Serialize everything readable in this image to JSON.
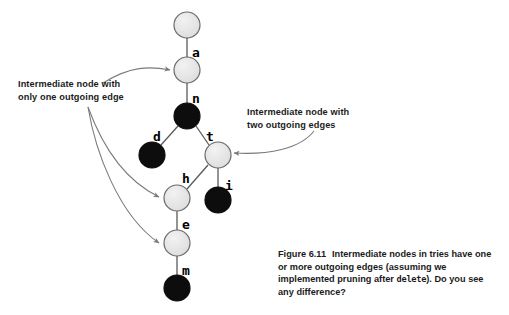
{
  "figure": {
    "nodes": [
      {
        "id": "root",
        "label": "",
        "cx": 187,
        "cy": 25,
        "r": 13,
        "fill": "#e3e3e3",
        "kind": "intermediate"
      },
      {
        "id": "a",
        "label": "",
        "cx": 187,
        "cy": 70,
        "r": 13,
        "fill": "#e3e3e3",
        "kind": "intermediate"
      },
      {
        "id": "n",
        "label": "",
        "cx": 187,
        "cy": 116,
        "r": 13,
        "fill": "#0d0d0d",
        "kind": "terminal"
      },
      {
        "id": "d",
        "label": "",
        "cx": 152,
        "cy": 155,
        "r": 13,
        "fill": "#0d0d0d",
        "kind": "terminal"
      },
      {
        "id": "t",
        "label": "",
        "cx": 218,
        "cy": 155,
        "r": 13,
        "fill": "#e3e3e3",
        "kind": "intermediate"
      },
      {
        "id": "h",
        "label": "",
        "cx": 177,
        "cy": 198,
        "r": 13,
        "fill": "#e3e3e3",
        "kind": "intermediate"
      },
      {
        "id": "i",
        "label": "",
        "cx": 218,
        "cy": 200,
        "r": 13,
        "fill": "#0d0d0d",
        "kind": "terminal"
      },
      {
        "id": "e",
        "label": "",
        "cx": 177,
        "cy": 243,
        "r": 13,
        "fill": "#e3e3e3",
        "kind": "intermediate"
      },
      {
        "id": "m",
        "label": "",
        "cx": 177,
        "cy": 288,
        "r": 13,
        "fill": "#0d0d0d",
        "kind": "terminal"
      }
    ],
    "edges": [
      {
        "from": "root",
        "to": "a",
        "label": "a",
        "label_x": 196,
        "label_y": 52
      },
      {
        "from": "a",
        "to": "n",
        "label": "n",
        "label_x": 196,
        "label_y": 98
      },
      {
        "from": "n",
        "to": "d",
        "label": "d",
        "label_x": 157,
        "label_y": 136
      },
      {
        "from": "n",
        "to": "t",
        "label": "t",
        "label_x": 209,
        "label_y": 136
      },
      {
        "from": "t",
        "to": "h",
        "label": "h",
        "label_x": 186,
        "label_y": 178
      },
      {
        "from": "t",
        "to": "i",
        "label": "i",
        "label_x": 228,
        "label_y": 186
      },
      {
        "from": "h",
        "to": "e",
        "label": "e",
        "label_x": 186,
        "label_y": 224
      },
      {
        "from": "e",
        "to": "m",
        "label": "m",
        "label_x": 186,
        "label_y": 270
      }
    ],
    "colors": {
      "intermediate_node": "#e3e3e3",
      "terminal_node": "#0d0d0d",
      "node_stroke": "#6b6b6b",
      "edge": "#5a5a5a",
      "leader": "#7a7a7a",
      "text": "#1b1b1b",
      "background": "#ffffff"
    }
  },
  "annotations": {
    "left": {
      "text": "Intermediate node with\nonly one outgoing edge",
      "targets": [
        "a",
        "h",
        "e"
      ]
    },
    "right": {
      "text": "Intermediate node with\ntwo outgoing edges",
      "targets": [
        "t"
      ]
    }
  },
  "caption": {
    "label": "Figure 6.11",
    "text_before": "Intermediate nodes in tries have one or more outgoing edges (assuming we implemented pruning after ",
    "code": "delete",
    "text_after": "). Do you see any difference?"
  }
}
